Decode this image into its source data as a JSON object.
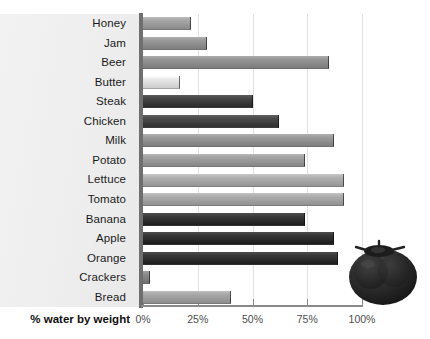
{
  "chart_data": {
    "type": "bar",
    "orientation": "horizontal",
    "title": "",
    "xlabel": "% water by weight",
    "ylabel": "",
    "categories": [
      "Honey",
      "Jam",
      "Beer",
      "Butter",
      "Steak",
      "Chicken",
      "Milk",
      "Potato",
      "Lettuce",
      "Tomato",
      "Banana",
      "Apple",
      "Orange",
      "Crackers",
      "Bread"
    ],
    "values": [
      22,
      29,
      85,
      17,
      50,
      62,
      87,
      74,
      92,
      92,
      74,
      87,
      89,
      3,
      40
    ],
    "xlim": [
      0,
      100
    ],
    "xticks": [
      0,
      25,
      50,
      75,
      100
    ],
    "xtick_labels": [
      "0%",
      "25%",
      "50%",
      "75%",
      "100%"
    ],
    "grid": true,
    "legend": false,
    "bar_colors": [
      "#9a9a9a",
      "#8e8e8e",
      "#8b8b8b",
      "#dcdcdc",
      "#3a3a3a",
      "#3f3f3f",
      "#8f8f8f",
      "#969696",
      "#a5a5a5",
      "#a1a1a1",
      "#2e2e2e",
      "#2b2b2b",
      "#2d2d2d",
      "#808080",
      "#9c9c9c"
    ]
  },
  "axis": {
    "title": "% water by weight",
    "ticks": [
      "0%",
      "25%",
      "50%",
      "75%",
      "100%"
    ]
  },
  "decoration": {
    "image_name": "tomato-photo"
  },
  "colors": {
    "panel_background": "#efefef",
    "axis_line": "#6f6f6f",
    "gridline": "#e2e2e2",
    "text": "#1a1a1a",
    "tick_text": "#4d4d4d"
  }
}
